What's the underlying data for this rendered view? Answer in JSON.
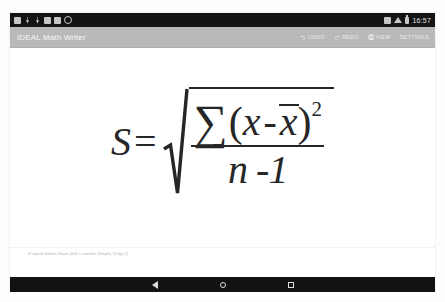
{
  "device": {
    "platform": "android-tablet"
  },
  "status_bar": {
    "background_color": "#141414",
    "clock": "16:57",
    "left_icons": [
      "screenshot-icon",
      "download-icon",
      "download-icon",
      "sd-card-icon",
      "sd-card-icon",
      "sync-icon"
    ],
    "right_icons": [
      "bluetooth-icon",
      "wifi-icon",
      "battery-icon"
    ]
  },
  "app_bar": {
    "background_color": "#b9b9b9",
    "title": "IDEAL Math Writer",
    "actions": [
      {
        "id": "undo",
        "label": "UNDO",
        "icon": "undo-icon"
      },
      {
        "id": "redo",
        "label": "REDO",
        "icon": "redo-icon"
      },
      {
        "id": "view",
        "label": "VIEW",
        "icon": "eye-icon"
      },
      {
        "id": "settings",
        "label": "SETTINGS",
        "icon": ""
      }
    ]
  },
  "content": {
    "background_color": "#ffffff",
    "ink_color": "#262626",
    "formula": {
      "plain_text": "S = sqrt( SUM (x - x̄)^2 / (n - 1) )",
      "lhs": "S",
      "equals": "=",
      "radical": {
        "numerator": {
          "sum_symbol": "∑",
          "open_paren": "(",
          "variable": "x",
          "minus": "-",
          "mean_variable": "x",
          "mean_has_overbar": true,
          "close_paren": ")",
          "exponent": "2"
        },
        "denominator": "n -1"
      }
    },
    "caption": "S equals Edition Exam (left) x overline (Graph) *(Clip) 1)"
  },
  "nav_bar": {
    "background_color": "#121212",
    "buttons": [
      {
        "id": "back",
        "icon": "back-triangle-icon"
      },
      {
        "id": "home",
        "icon": "home-circle-icon"
      },
      {
        "id": "recent",
        "icon": "recents-square-icon"
      }
    ]
  }
}
